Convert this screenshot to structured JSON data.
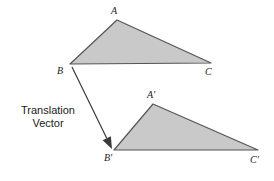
{
  "figure": {
    "background_color": "#ffffff",
    "shape_fill_color": "#c9c9c9",
    "shape_stroke_color": "#555555",
    "arrow_color": "#3a3a3a",
    "text_color": "#1a1a1a"
  },
  "caption": {
    "line1": "Translation",
    "line2": "Vector"
  },
  "labels": {
    "a": "A",
    "b": "B",
    "c": "C",
    "a_prime": "A'",
    "b_prime": "B'",
    "c_prime": "C'"
  },
  "chart_data": {
    "type": "diagram",
    "title": "",
    "coordinate_system": "pixels, origin top-left, y increases downward",
    "shapes": [
      {
        "name": "triangle-abc",
        "type": "polygon",
        "fill": "#c9c9c9",
        "stroke": "#555555",
        "vertices": [
          {
            "label": "A",
            "x": 117,
            "y": 20
          },
          {
            "label": "C",
            "x": 211,
            "y": 63
          },
          {
            "label": "B",
            "x": 70,
            "y": 64
          }
        ]
      },
      {
        "name": "triangle-a-prime-b-prime-c-prime",
        "type": "polygon",
        "fill": "#c9c9c9",
        "stroke": "#555555",
        "vertices": [
          {
            "label": "A'",
            "x": 153,
            "y": 104
          },
          {
            "label": "C'",
            "x": 258,
            "y": 150
          },
          {
            "label": "B'",
            "x": 114,
            "y": 150
          }
        ]
      }
    ],
    "vectors": [
      {
        "name": "translation-vector",
        "type": "arrow",
        "from": {
          "x": 72,
          "y": 67,
          "at": "B"
        },
        "to": {
          "x": 112,
          "y": 149,
          "at": "B'"
        },
        "dx": 40,
        "dy": 82,
        "color": "#3a3a3a",
        "arrowhead": "filled"
      }
    ],
    "annotations": [
      {
        "name": "caption",
        "text": "Translation Vector",
        "x": 47,
        "y": 117
      }
    ]
  },
  "label_positions": {
    "a": {
      "left": 111,
      "top": 6
    },
    "b": {
      "left": 57,
      "top": 66
    },
    "c": {
      "left": 205,
      "top": 67
    },
    "a_prime": {
      "left": 147,
      "top": 90
    },
    "b_prime": {
      "left": 104,
      "top": 153
    },
    "c_prime": {
      "left": 250,
      "top": 155
    }
  }
}
